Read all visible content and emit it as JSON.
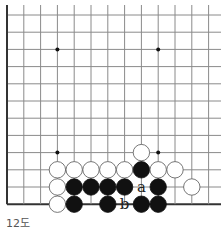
{
  "diagram": {
    "caption": "12도",
    "colors": {
      "line": "#8a8a8a",
      "edge": "#333333",
      "black": "#111111",
      "white": "#ffffff",
      "star": "#111111"
    },
    "grid": {
      "x0": 7,
      "y0": 15,
      "dx": 16.8,
      "dy": 17.2,
      "cols": 13,
      "rows": 12,
      "top_extend": 5,
      "right_extend": 221,
      "left_edge": true,
      "bottom_edge": true
    },
    "star_points": [
      [
        3,
        2
      ],
      [
        9,
        2
      ],
      [
        3,
        8
      ],
      [
        9,
        8
      ]
    ],
    "stones": [
      {
        "col": 8,
        "row": 8,
        "color": "white"
      },
      {
        "col": 3,
        "row": 9,
        "color": "white"
      },
      {
        "col": 4,
        "row": 9,
        "color": "white"
      },
      {
        "col": 5,
        "row": 9,
        "color": "white"
      },
      {
        "col": 6,
        "row": 9,
        "color": "white"
      },
      {
        "col": 7,
        "row": 9,
        "color": "white"
      },
      {
        "col": 8,
        "row": 9,
        "color": "black"
      },
      {
        "col": 9,
        "row": 9,
        "color": "white"
      },
      {
        "col": 10,
        "row": 9,
        "color": "white"
      },
      {
        "col": 3,
        "row": 10,
        "color": "white"
      },
      {
        "col": 4,
        "row": 10,
        "color": "black"
      },
      {
        "col": 5,
        "row": 10,
        "color": "black"
      },
      {
        "col": 6,
        "row": 10,
        "color": "black"
      },
      {
        "col": 7,
        "row": 10,
        "color": "black"
      },
      {
        "col": 9,
        "row": 10,
        "color": "black"
      },
      {
        "col": 11,
        "row": 10,
        "color": "white"
      },
      {
        "col": 3,
        "row": 11,
        "color": "white"
      },
      {
        "col": 4,
        "row": 11,
        "color": "black"
      },
      {
        "col": 6,
        "row": 11,
        "color": "black"
      },
      {
        "col": 8,
        "row": 11,
        "color": "black"
      },
      {
        "col": 9,
        "row": 11,
        "color": "black"
      }
    ],
    "labels": [
      {
        "col": 8,
        "row": 10,
        "text": "a"
      },
      {
        "col": 7,
        "row": 11,
        "text": "b"
      }
    ]
  }
}
